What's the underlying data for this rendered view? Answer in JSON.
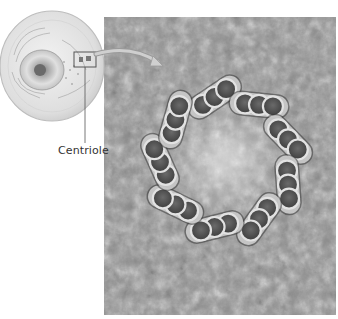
{
  "diagram": {
    "labels": {
      "centriole": "Centriole"
    },
    "components": {
      "cell_overview": "cell-illustration",
      "magnified_view": "centriole-cross-section",
      "triplet_count": 9,
      "microtubules_per_triplet": 3
    },
    "colors": {
      "background": "#ffffff",
      "texture": "#8a8a8a",
      "tubule_fill": "#555555",
      "tubule_ring": "#d8d8d8",
      "label_text": "#333333"
    }
  }
}
